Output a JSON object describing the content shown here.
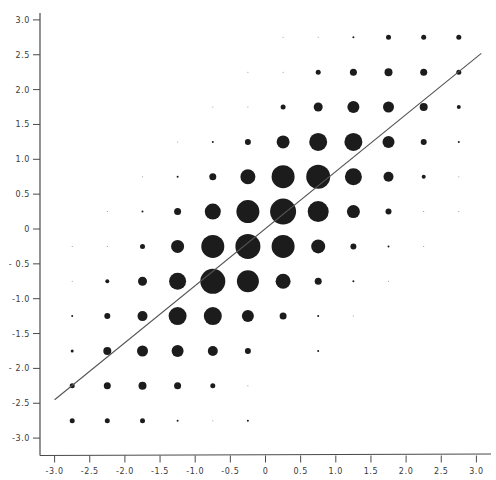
{
  "chart_data": {
    "type": "scatter",
    "subtype": "bubble-grid",
    "title": "",
    "xlabel": "",
    "ylabel": "",
    "xlim": [
      -3.0,
      3.0
    ],
    "ylim": [
      -3.0,
      3.0
    ],
    "grid": false,
    "legend": null,
    "x_ticks": [
      -3.0,
      -2.5,
      -2.0,
      -1.5,
      -1.0,
      -0.5,
      0,
      0.5,
      1.0,
      1.5,
      2.0,
      2.5,
      3.0
    ],
    "x_tick_labels": [
      "-3.0",
      "-2.5",
      "-2.0",
      "-1.5",
      "-1.0",
      "-0.5",
      "0",
      "0.5",
      "1.0",
      "1.5",
      "2.0",
      "2.5",
      "3.0"
    ],
    "y_ticks": [
      3.0,
      2.5,
      2.0,
      1.5,
      1.0,
      0.5,
      0,
      -0.5,
      -1.0,
      -1.5,
      -2.0,
      -2.5,
      -3.0
    ],
    "y_tick_labels": [
      "3.0",
      "2.5",
      "2.0",
      "1.5",
      "1.0",
      "0.5",
      "0",
      "- 0.5",
      "-1.0",
      "-1.5",
      "- 2.0",
      "-2.5",
      "-3.0"
    ],
    "size_unit": "approximate bubble diameter (px), proportional to cell frequency",
    "points": [
      {
        "x": 0.25,
        "y": 2.75,
        "size": 1
      },
      {
        "x": 0.75,
        "y": 2.75,
        "size": 1
      },
      {
        "x": 1.25,
        "y": 2.75,
        "size": 2
      },
      {
        "x": 1.75,
        "y": 2.75,
        "size": 5
      },
      {
        "x": 2.25,
        "y": 2.75,
        "size": 5
      },
      {
        "x": 2.75,
        "y": 2.75,
        "size": 5
      },
      {
        "x": -0.25,
        "y": 2.25,
        "size": 1
      },
      {
        "x": 0.25,
        "y": 2.25,
        "size": 1
      },
      {
        "x": 0.75,
        "y": 2.25,
        "size": 5
      },
      {
        "x": 1.25,
        "y": 2.25,
        "size": 7
      },
      {
        "x": 1.75,
        "y": 2.25,
        "size": 8
      },
      {
        "x": 2.25,
        "y": 2.25,
        "size": 7
      },
      {
        "x": 2.75,
        "y": 2.25,
        "size": 5
      },
      {
        "x": -0.75,
        "y": 1.75,
        "size": 1
      },
      {
        "x": -0.25,
        "y": 1.75,
        "size": 1
      },
      {
        "x": 0.25,
        "y": 1.75,
        "size": 5
      },
      {
        "x": 0.75,
        "y": 1.75,
        "size": 9
      },
      {
        "x": 1.25,
        "y": 1.75,
        "size": 12
      },
      {
        "x": 1.75,
        "y": 1.75,
        "size": 11
      },
      {
        "x": 2.25,
        "y": 1.75,
        "size": 8
      },
      {
        "x": 2.75,
        "y": 1.75,
        "size": 4
      },
      {
        "x": -1.25,
        "y": 1.25,
        "size": 1
      },
      {
        "x": -0.75,
        "y": 1.25,
        "size": 2
      },
      {
        "x": -0.25,
        "y": 1.25,
        "size": 6
      },
      {
        "x": 0.25,
        "y": 1.25,
        "size": 13
      },
      {
        "x": 0.75,
        "y": 1.25,
        "size": 18
      },
      {
        "x": 1.25,
        "y": 1.25,
        "size": 18
      },
      {
        "x": 1.75,
        "y": 1.25,
        "size": 12
      },
      {
        "x": 2.25,
        "y": 1.25,
        "size": 6
      },
      {
        "x": 2.75,
        "y": 1.25,
        "size": 2
      },
      {
        "x": -1.75,
        "y": 0.75,
        "size": 1
      },
      {
        "x": -1.25,
        "y": 0.75,
        "size": 2
      },
      {
        "x": -0.75,
        "y": 0.75,
        "size": 7
      },
      {
        "x": -0.25,
        "y": 0.75,
        "size": 15
      },
      {
        "x": 0.25,
        "y": 0.75,
        "size": 23
      },
      {
        "x": 0.75,
        "y": 0.75,
        "size": 24
      },
      {
        "x": 1.25,
        "y": 0.75,
        "size": 17
      },
      {
        "x": 1.75,
        "y": 0.75,
        "size": 10
      },
      {
        "x": 2.25,
        "y": 0.75,
        "size": 4
      },
      {
        "x": 2.75,
        "y": 0.75,
        "size": 1
      },
      {
        "x": -2.25,
        "y": 0.25,
        "size": 1
      },
      {
        "x": -1.75,
        "y": 0.25,
        "size": 2
      },
      {
        "x": -1.25,
        "y": 0.25,
        "size": 7
      },
      {
        "x": -0.75,
        "y": 0.25,
        "size": 16
      },
      {
        "x": -0.25,
        "y": 0.25,
        "size": 23
      },
      {
        "x": 0.25,
        "y": 0.25,
        "size": 26
      },
      {
        "x": 0.75,
        "y": 0.25,
        "size": 21
      },
      {
        "x": 1.25,
        "y": 0.25,
        "size": 13
      },
      {
        "x": 1.75,
        "y": 0.25,
        "size": 6
      },
      {
        "x": 2.25,
        "y": 0.25,
        "size": 1
      },
      {
        "x": 2.75,
        "y": 0.25,
        "size": 1
      },
      {
        "x": -2.75,
        "y": -0.25,
        "size": 1
      },
      {
        "x": -2.25,
        "y": -0.25,
        "size": 1
      },
      {
        "x": -1.75,
        "y": -0.25,
        "size": 5
      },
      {
        "x": -1.25,
        "y": -0.25,
        "size": 13
      },
      {
        "x": -0.75,
        "y": -0.25,
        "size": 23
      },
      {
        "x": -0.25,
        "y": -0.25,
        "size": 25
      },
      {
        "x": 0.25,
        "y": -0.25,
        "size": 23
      },
      {
        "x": 0.75,
        "y": -0.25,
        "size": 14
      },
      {
        "x": 1.25,
        "y": -0.25,
        "size": 6
      },
      {
        "x": 1.75,
        "y": -0.25,
        "size": 2
      },
      {
        "x": 2.25,
        "y": -0.25,
        "size": 1
      },
      {
        "x": -2.75,
        "y": -0.75,
        "size": 1
      },
      {
        "x": -2.25,
        "y": -0.75,
        "size": 4
      },
      {
        "x": -1.75,
        "y": -0.75,
        "size": 9
      },
      {
        "x": -1.25,
        "y": -0.75,
        "size": 17
      },
      {
        "x": -0.75,
        "y": -0.75,
        "size": 25
      },
      {
        "x": -0.25,
        "y": -0.75,
        "size": 22
      },
      {
        "x": 0.25,
        "y": -0.75,
        "size": 15
      },
      {
        "x": 0.75,
        "y": -0.75,
        "size": 7
      },
      {
        "x": 1.25,
        "y": -0.75,
        "size": 2
      },
      {
        "x": 1.75,
        "y": -0.75,
        "size": 1
      },
      {
        "x": -2.75,
        "y": -1.25,
        "size": 2
      },
      {
        "x": -2.25,
        "y": -1.25,
        "size": 6
      },
      {
        "x": -1.75,
        "y": -1.25,
        "size": 10
      },
      {
        "x": -1.25,
        "y": -1.25,
        "size": 18
      },
      {
        "x": -0.75,
        "y": -1.25,
        "size": 18
      },
      {
        "x": -0.25,
        "y": -1.25,
        "size": 12
      },
      {
        "x": 0.25,
        "y": -1.25,
        "size": 7
      },
      {
        "x": 0.75,
        "y": -1.25,
        "size": 2
      },
      {
        "x": 1.25,
        "y": -1.25,
        "size": 1
      },
      {
        "x": -2.75,
        "y": -1.75,
        "size": 3
      },
      {
        "x": -2.25,
        "y": -1.75,
        "size": 8
      },
      {
        "x": -1.75,
        "y": -1.75,
        "size": 11
      },
      {
        "x": -1.25,
        "y": -1.75,
        "size": 12
      },
      {
        "x": -0.75,
        "y": -1.75,
        "size": 10
      },
      {
        "x": -0.25,
        "y": -1.75,
        "size": 6
      },
      {
        "x": 0.75,
        "y": -1.75,
        "size": 2
      },
      {
        "x": -2.75,
        "y": -2.25,
        "size": 5
      },
      {
        "x": -2.25,
        "y": -2.25,
        "size": 7
      },
      {
        "x": -1.75,
        "y": -2.25,
        "size": 8
      },
      {
        "x": -1.25,
        "y": -2.25,
        "size": 7
      },
      {
        "x": -0.75,
        "y": -2.25,
        "size": 5
      },
      {
        "x": -0.25,
        "y": -2.25,
        "size": 1
      },
      {
        "x": -2.75,
        "y": -2.75,
        "size": 5
      },
      {
        "x": -2.25,
        "y": -2.75,
        "size": 5
      },
      {
        "x": -1.75,
        "y": -2.75,
        "size": 5
      },
      {
        "x": -1.25,
        "y": -2.75,
        "size": 2
      },
      {
        "x": -0.75,
        "y": -2.75,
        "size": 1
      },
      {
        "x": -0.25,
        "y": -2.75,
        "size": 2
      }
    ],
    "fit_line": {
      "from": {
        "x": -3.0,
        "y": -2.45
      },
      "to": {
        "x": 3.07,
        "y": 2.52
      },
      "slope": 0.82
    }
  },
  "colors": {
    "background": "#ffffff",
    "dots": "#1c1c1c",
    "axes": "#4a4a4a",
    "line": "#555555",
    "text": "#3a3a3a"
  }
}
